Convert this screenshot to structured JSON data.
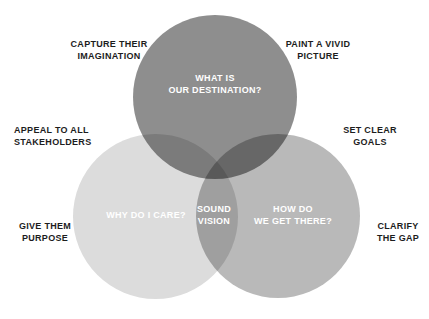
{
  "diagram": {
    "type": "venn",
    "background_color": "#ffffff",
    "circles": [
      {
        "id": "top",
        "name": "capture-their-imagination",
        "color": "#8e8e8e",
        "inner_label": "WHAT IS\nOUR DESTINATION?",
        "outer_labels": [
          "CAPTURE THEIR\nIMAGINATION",
          "PAINT A VIVID\nPICTURE"
        ]
      },
      {
        "id": "left",
        "name": "appeal-to-all-stakeholders",
        "color": "#dcdcdc",
        "inner_label": "WHY DO I CARE?",
        "outer_labels": [
          "APPEAL TO ALL\nSTAKEHOLDERS",
          "GIVE THEM\nPURPOSE"
        ]
      },
      {
        "id": "right",
        "name": "set-clear-goals",
        "color": "#b9b9b9",
        "inner_label": "HOW DO\nWE GET THERE?",
        "outer_labels": [
          "SET CLEAR\nGOALS",
          "CLARIFY\nTHE GAP"
        ]
      }
    ],
    "center_label": "SOUND\nVISION",
    "inner_text_color": "#ffffff",
    "outer_text_color": "#1d1d1d"
  },
  "inner_labels": {
    "destination": "WHAT IS\nOUR DESTINATION?",
    "why_care": "WHY DO I CARE?",
    "how_do_we_get_there": "HOW DO\nWE GET THERE?",
    "sound_vision": "SOUND\nVISION"
  },
  "outer_labels": {
    "capture_their_imagination": "CAPTURE THEIR\nIMAGINATION",
    "paint_a_vivid_picture": "PAINT A VIVID\nPICTURE",
    "appeal_to_all_stakeholders": "APPEAL TO ALL\nSTAKEHOLDERS",
    "set_clear_goals": "SET CLEAR\nGOALS",
    "give_them_purpose": "GIVE THEM\nPURPOSE",
    "clarify_the_gap": "CLARIFY\nTHE GAP"
  }
}
